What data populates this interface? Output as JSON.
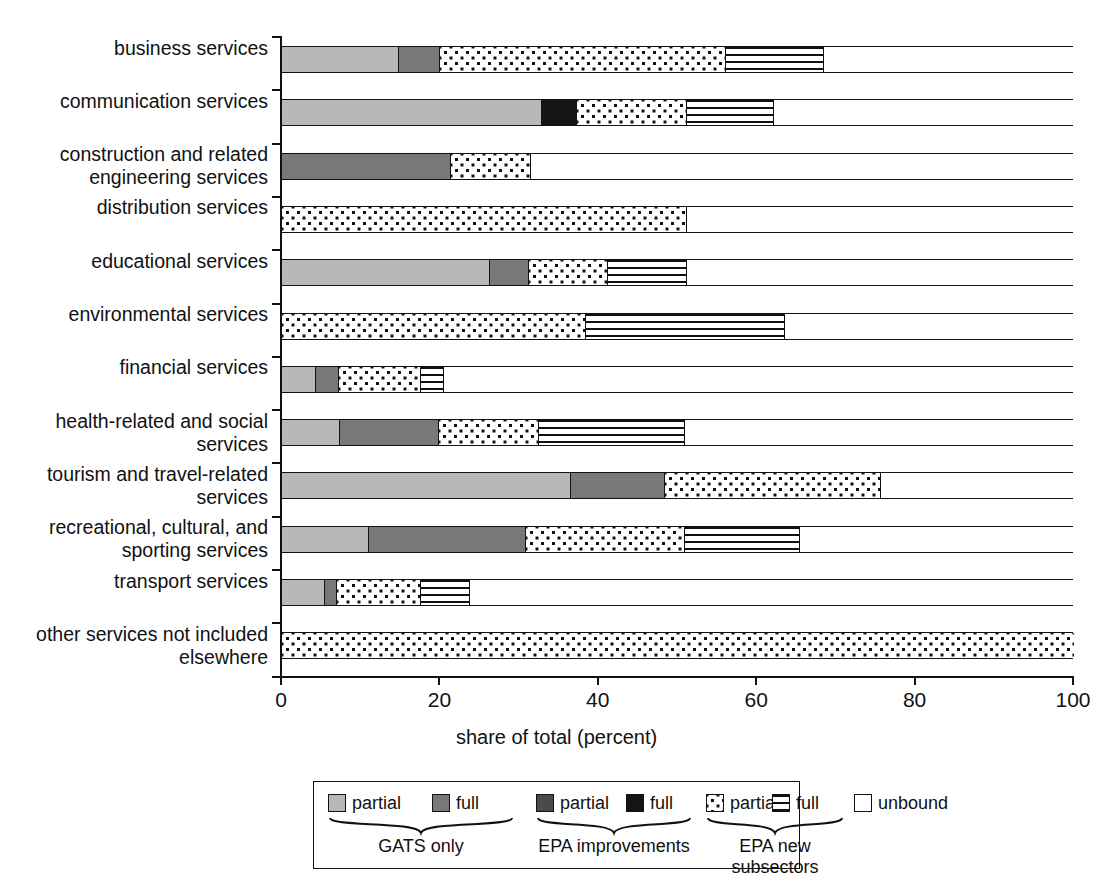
{
  "chart_data": {
    "type": "bar",
    "orientation": "horizontal",
    "stacked": true,
    "title": "",
    "xlabel": "share of total (percent)",
    "ylabel": "",
    "xlim": [
      0,
      100
    ],
    "xticks": [
      0,
      20,
      40,
      60,
      80,
      100
    ],
    "grid": false,
    "legend_position": "bottom",
    "categories": [
      "business services",
      "communication services",
      "construction and related engineering services",
      "distribution services",
      "educational services",
      "environmental services",
      "financial services",
      "health-related and social services",
      "tourism and travel-related services",
      "recreational, cultural, and sporting services",
      "transport services",
      "other services not included elsewhere"
    ],
    "series": [
      {
        "name": "GATS only partial",
        "key": "gats_partial",
        "fill": "light-gray",
        "values": [
          14.8,
          32.8,
          0,
          0,
          26.2,
          0,
          4.3,
          7.3,
          36.5,
          11.0,
          5.4,
          0
        ]
      },
      {
        "name": "GATS only full",
        "key": "gats_full",
        "fill": "medium-gray",
        "values": [
          5.2,
          0,
          21.3,
          0,
          5.0,
          0,
          2.9,
          12.5,
          11.9,
          19.8,
          1.6,
          0
        ]
      },
      {
        "name": "EPA improvements partial",
        "key": "epa_partial",
        "fill": "dark-gray",
        "values": [
          0,
          0,
          0,
          0,
          0,
          0,
          0,
          0,
          0,
          0,
          0,
          0
        ]
      },
      {
        "name": "EPA improvements full",
        "key": "epa_full",
        "fill": "black",
        "values": [
          0,
          4.4,
          0,
          0,
          0,
          0,
          0,
          0,
          0,
          0,
          0,
          0
        ]
      },
      {
        "name": "EPA new subsectors partial",
        "key": "new_partial",
        "fill": "dotted",
        "values": [
          36.0,
          13.9,
          10.1,
          51.1,
          10.0,
          38.4,
          10.4,
          12.6,
          27.2,
          20.1,
          10.6,
          100
        ]
      },
      {
        "name": "EPA new subsectors full",
        "key": "new_full",
        "fill": "striped",
        "values": [
          12.4,
          11.0,
          0,
          0,
          9.9,
          25.1,
          2.8,
          18.5,
          0,
          14.5,
          6.1,
          0
        ]
      },
      {
        "name": "unbound",
        "key": "unbound",
        "fill": "white",
        "values": [
          31.6,
          37.9,
          68.6,
          48.9,
          48.9,
          36.5,
          79.6,
          49.1,
          24.4,
          34.6,
          76.3,
          0
        ]
      }
    ]
  },
  "axis": {
    "x_title": "share of total (percent)",
    "tick_labels": [
      "0",
      "20",
      "40",
      "60",
      "80",
      "100"
    ]
  },
  "legend": {
    "items": [
      {
        "label": "partial",
        "fill": "light-gray",
        "group": "GATS only"
      },
      {
        "label": "full",
        "fill": "medium-gray",
        "group": "GATS only"
      },
      {
        "label": "partial",
        "fill": "dark-gray",
        "group": "EPA improvements"
      },
      {
        "label": "full",
        "fill": "black",
        "group": "EPA improvements"
      },
      {
        "label": "partial",
        "fill": "dotted",
        "group": "EPA new subsectors"
      },
      {
        "label": "full",
        "fill": "striped",
        "group": "EPA new subsectors"
      },
      {
        "label": "unbound",
        "fill": "white",
        "group": ""
      }
    ],
    "groups": [
      "GATS only",
      "EPA improvements",
      "EPA new subsectors"
    ]
  },
  "colors": {
    "light_gray": "#b8b8b8",
    "medium_gray": "#787878",
    "dark_gray": "#4a4a4a",
    "black": "#151515",
    "outline": "#111111",
    "background": "#ffffff"
  }
}
